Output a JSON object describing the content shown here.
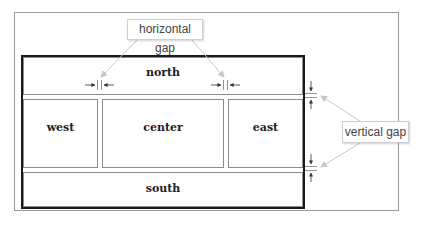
{
  "diagram": {
    "regions": {
      "north": "north",
      "west": "west",
      "center": "center",
      "east": "east",
      "south": "south"
    },
    "callouts": {
      "horizontal_gap": "horizontal gap",
      "vertical_gap": "vertical gap"
    },
    "colors": {
      "container_border": "#1a1a1a",
      "region_border": "#8c8c8c",
      "frame_border": "#9a9a9a",
      "callout_leader": "#bdbdbd",
      "gap_arrow": "#333333"
    }
  }
}
